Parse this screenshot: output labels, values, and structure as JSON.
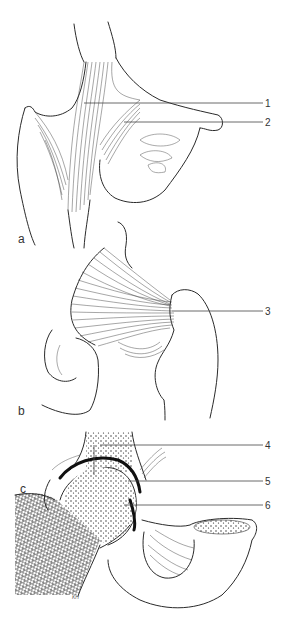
{
  "figure": {
    "panels": [
      {
        "id": "a",
        "label": "a"
      },
      {
        "id": "b",
        "label": "b"
      },
      {
        "id": "c",
        "label": "c"
      }
    ],
    "callouts": [
      {
        "number": "1",
        "panel": "a"
      },
      {
        "number": "2",
        "panel": "a"
      },
      {
        "number": "3",
        "panel": "b"
      },
      {
        "number": "4",
        "panel": "c"
      },
      {
        "number": "5",
        "panel": "c"
      },
      {
        "number": "6",
        "panel": "c"
      }
    ],
    "signature": "KH"
  }
}
